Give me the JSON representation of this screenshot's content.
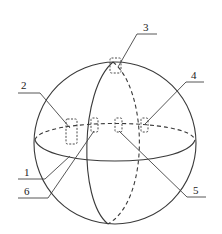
{
  "figure": {
    "type": "technical-diagram",
    "sphere": {
      "outline": "solid circle",
      "equator": "ellipse (front solid, back dashed)",
      "meridian": "ellipse (front solid, back dashed)"
    },
    "labels": [
      {
        "id": "1",
        "text": "1",
        "target": "sphere shell"
      },
      {
        "id": "2",
        "text": "2",
        "target": "sensor module on left equator"
      },
      {
        "id": "3",
        "text": "3",
        "target": "sensor module at top pole"
      },
      {
        "id": "4",
        "text": "4",
        "target": "sensor module on right equator"
      },
      {
        "id": "5",
        "text": "5",
        "target": "sensor module center-right on equator"
      },
      {
        "id": "6",
        "text": "6",
        "target": "sensor module center-left on equator"
      }
    ],
    "colors": {
      "line": "#3a3a3a",
      "background": "#ffffff"
    }
  }
}
